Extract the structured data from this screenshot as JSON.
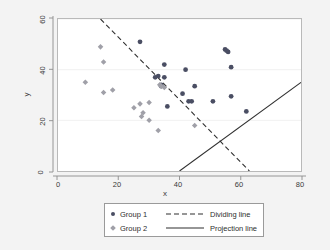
{
  "chart_data": {
    "type": "scatter",
    "title": "",
    "xlabel": "x",
    "ylabel": "y",
    "xlim": [
      0,
      80
    ],
    "ylim": [
      0,
      60
    ],
    "xticks": [
      0,
      20,
      40,
      60,
      80
    ],
    "yticks": [
      0,
      20,
      40,
      60
    ],
    "grid": "horizontal-faint",
    "legend_position": "below-plot",
    "series": [
      {
        "name": "Group 1",
        "marker": "circle",
        "color": "#4a4e63",
        "points": [
          [
            27,
            51
          ],
          [
            35,
            42
          ],
          [
            42,
            40
          ],
          [
            55,
            48
          ],
          [
            56,
            47
          ],
          [
            57,
            41
          ],
          [
            33,
            37.5
          ],
          [
            35,
            37
          ],
          [
            45,
            33.5
          ],
          [
            41,
            30.5
          ],
          [
            34,
            33.5
          ],
          [
            43,
            27.5
          ],
          [
            51,
            27.5
          ],
          [
            57,
            29.5
          ],
          [
            62,
            23.5
          ],
          [
            36,
            25.5
          ],
          [
            32,
            37
          ],
          [
            34,
            34
          ],
          [
            55.5,
            47.5
          ],
          [
            44,
            27.5
          ]
        ]
      },
      {
        "name": "Group 2",
        "marker": "diamond",
        "color": "#a0a0a8",
        "points": [
          [
            14,
            49
          ],
          [
            15,
            43
          ],
          [
            9,
            35
          ],
          [
            15,
            31
          ],
          [
            18,
            32
          ],
          [
            25,
            25
          ],
          [
            27,
            26.5
          ],
          [
            30,
            27
          ],
          [
            28,
            23
          ],
          [
            27.5,
            21.5
          ],
          [
            30,
            20
          ],
          [
            34,
            33.5
          ],
          [
            33.5,
            34
          ],
          [
            33,
            16
          ],
          [
            45,
            18
          ],
          [
            35,
            33
          ]
        ]
      }
    ],
    "lines": [
      {
        "name": "Dividing line",
        "style": "dashed",
        "color": "#2f2f2f",
        "from": [
          14,
          60
        ],
        "to": [
          63,
          0
        ]
      },
      {
        "name": "Projection line",
        "style": "solid",
        "color": "#2f2f2f",
        "from": [
          40,
          0
        ],
        "to": [
          80,
          35
        ]
      }
    ]
  },
  "legend": {
    "entries": [
      {
        "label": "Group 1",
        "marker": "circle"
      },
      {
        "label": "Group 2",
        "marker": "diamond"
      },
      {
        "label": "Dividing line",
        "style": "dashed"
      },
      {
        "label": "Projection line",
        "style": "solid"
      }
    ]
  },
  "axes": {
    "x_title": "x",
    "y_title": "y",
    "x_tick_labels": [
      "0",
      "20",
      "40",
      "60",
      "80"
    ],
    "y_tick_labels": [
      "0",
      "20",
      "40",
      "60"
    ]
  },
  "colors": {
    "background": "#f3f3f3",
    "plot_background": "#ffffff",
    "group1": "#4a4e63",
    "group2": "#a0a0a8",
    "line": "#2f2f2f",
    "axis": "#8d8d8d",
    "grid": "#ededed"
  }
}
